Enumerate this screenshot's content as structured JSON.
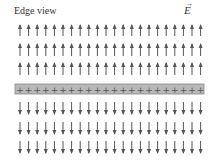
{
  "title": "Edge view",
  "field_symbol": "E",
  "field_vector_mark": "→",
  "plate": {
    "charge_sign": "+",
    "charge_count": 22,
    "fill": "#b8b8b8",
    "border": "#888888"
  },
  "arrows": {
    "columns": 22,
    "rows_above": 3,
    "rows_below": 3,
    "direction_above": "up",
    "direction_below": "down",
    "color": "#555555"
  }
}
